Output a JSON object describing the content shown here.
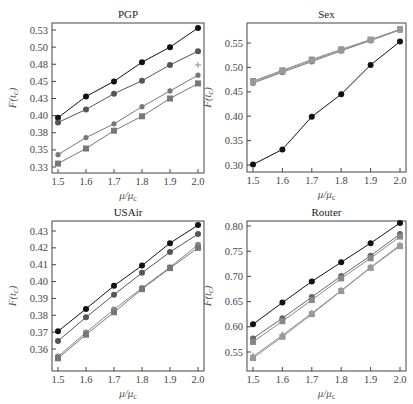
{
  "figure": {
    "caption": ""
  },
  "chart_data": [
    {
      "type": "line",
      "title": "PGP",
      "xlabel": "μ/μc",
      "ylabel": "F(tc)",
      "x": [
        1.5,
        1.6,
        1.7,
        1.8,
        1.9,
        2.0
      ],
      "xticks": [
        "1.5",
        "1.6",
        "1.7",
        "1.8",
        "1.9",
        "2.0"
      ],
      "xlim": [
        1.5,
        2.0
      ],
      "ylim": [
        0.325,
        0.525
      ],
      "yticks": [
        0.325,
        0.35,
        0.375,
        0.4,
        0.425,
        0.45,
        0.475,
        0.5,
        0.525
      ],
      "ytick_labels": [
        "0.33",
        "0.35",
        "0.38",
        "0.40",
        "0.43",
        "0.45",
        "0.48",
        "0.50",
        "0.53"
      ],
      "grid": false,
      "series": [
        {
          "name": "series-1",
          "marker": "circle",
          "color": "#111111",
          "values": [
            0.397,
            0.428,
            0.45,
            0.478,
            0.5,
            0.528
          ]
        },
        {
          "name": "series-2",
          "marker": "circle",
          "color": "#555555",
          "values": [
            0.39,
            0.409,
            0.432,
            0.451,
            0.474,
            0.494
          ]
        },
        {
          "name": "series-3",
          "marker": "circle-small",
          "color": "#777777",
          "values": [
            0.343,
            0.368,
            0.388,
            0.413,
            0.436,
            0.459
          ]
        },
        {
          "name": "series-4",
          "marker": "square",
          "color": "#777777",
          "values": [
            0.33,
            0.352,
            0.378,
            0.399,
            0.425,
            0.447
          ]
        }
      ],
      "annotations": [
        {
          "type": "plus",
          "x": 2.0,
          "y": 0.474
        }
      ]
    },
    {
      "type": "line",
      "title": "Sex",
      "xlabel": "μ/μc",
      "ylabel": "F(tc)",
      "x": [
        1.5,
        1.6,
        1.7,
        1.8,
        1.9,
        2.0
      ],
      "xticks": [
        "1.5",
        "1.6",
        "1.7",
        "1.8",
        "1.9",
        "2.0"
      ],
      "xlim": [
        1.5,
        2.0
      ],
      "ylim": [
        0.3,
        0.55
      ],
      "yticks": [
        0.3,
        0.35,
        0.4,
        0.45,
        0.5,
        0.55
      ],
      "ytick_labels": [
        "0.30",
        "0.35",
        "0.40",
        "0.45",
        "0.50",
        "0.55"
      ],
      "grid": false,
      "series": [
        {
          "name": "series-1",
          "marker": "circle",
          "color": "#111111",
          "values": [
            0.301,
            0.332,
            0.399,
            0.445,
            0.505,
            0.553
          ]
        },
        {
          "name": "series-2",
          "marker": "square",
          "color": "#888888",
          "values": [
            0.472,
            0.494,
            0.516,
            0.537,
            0.557,
            0.578
          ]
        },
        {
          "name": "series-3",
          "marker": "circle",
          "color": "#777777",
          "values": [
            0.468,
            0.49,
            0.512,
            0.534,
            0.555,
            0.577
          ]
        },
        {
          "name": "series-4",
          "marker": "square",
          "color": "#999999",
          "values": [
            0.47,
            0.492,
            0.514,
            0.535,
            0.556,
            0.578
          ]
        }
      ]
    },
    {
      "type": "line",
      "title": "USAir",
      "xlabel": "μ/μc",
      "ylabel": "F(tc)",
      "x": [
        1.5,
        1.6,
        1.7,
        1.8,
        1.9,
        2.0
      ],
      "xticks": [
        "1.5",
        "1.6",
        "1.7",
        "1.8",
        "1.9",
        "2.0"
      ],
      "xlim": [
        1.5,
        2.0
      ],
      "ylim": [
        0.36,
        0.43
      ],
      "yticks": [
        0.36,
        0.37,
        0.38,
        0.39,
        0.4,
        0.41,
        0.42,
        0.43
      ],
      "ytick_labels": [
        "0.36",
        "0.37",
        "0.38",
        "0.39",
        "0.40",
        "0.41",
        "0.42",
        "0.43"
      ],
      "grid": false,
      "series": [
        {
          "name": "series-1",
          "marker": "circle",
          "color": "#111111",
          "values": [
            0.3705,
            0.3838,
            0.3975,
            0.4095,
            0.4228,
            0.4335
          ]
        },
        {
          "name": "series-2",
          "marker": "circle",
          "color": "#555555",
          "values": [
            0.3648,
            0.3788,
            0.3922,
            0.4052,
            0.4175,
            0.4282
          ]
        },
        {
          "name": "series-3",
          "marker": "circle",
          "color": "#888888",
          "values": [
            0.3555,
            0.3698,
            0.3835,
            0.3962,
            0.4085,
            0.4218
          ]
        },
        {
          "name": "series-4",
          "marker": "square",
          "color": "#777777",
          "values": [
            0.3545,
            0.3685,
            0.3818,
            0.3955,
            0.408,
            0.42
          ]
        }
      ]
    },
    {
      "type": "line",
      "title": "Router",
      "xlabel": "μ/μc",
      "ylabel": "F(tc)",
      "x": [
        1.5,
        1.6,
        1.7,
        1.8,
        1.9,
        2.0
      ],
      "xticks": [
        "1.5",
        "1.6",
        "1.7",
        "1.8",
        "1.9",
        "2.0"
      ],
      "xlim": [
        1.5,
        2.0
      ],
      "ylim": [
        0.55,
        0.8
      ],
      "yticks": [
        0.55,
        0.6,
        0.65,
        0.7,
        0.75,
        0.8
      ],
      "ytick_labels": [
        "0.55",
        "0.60",
        "0.65",
        "0.70",
        "0.75",
        "0.80"
      ],
      "grid": false,
      "series": [
        {
          "name": "series-1",
          "marker": "circle",
          "color": "#111111",
          "values": [
            0.605,
            0.648,
            0.69,
            0.728,
            0.766,
            0.806
          ]
        },
        {
          "name": "series-2",
          "marker": "circle",
          "color": "#666666",
          "values": [
            0.577,
            0.617,
            0.659,
            0.701,
            0.741,
            0.784
          ]
        },
        {
          "name": "series-3",
          "marker": "square",
          "color": "#888888",
          "values": [
            0.57,
            0.611,
            0.653,
            0.696,
            0.736,
            0.779
          ]
        },
        {
          "name": "series-4",
          "marker": "triangle",
          "color": "#888888",
          "values": [
            0.541,
            0.583,
            0.627,
            0.672,
            0.718,
            0.762
          ]
        },
        {
          "name": "series-5",
          "marker": "square",
          "color": "#999999",
          "values": [
            0.538,
            0.58,
            0.625,
            0.671,
            0.717,
            0.76
          ]
        }
      ]
    }
  ]
}
